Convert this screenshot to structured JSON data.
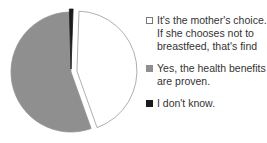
{
  "chart_data": {
    "type": "pie",
    "title": "",
    "slices": [
      {
        "label": "It's the mother's choice. If she chooses not to breastfeed, that's find",
        "value": 44,
        "fill": "#ffffff",
        "stroke": "#999999",
        "exploded": true
      },
      {
        "label": "Yes, the health benefits are proven.",
        "value": 55,
        "fill": "#8f8f8f",
        "stroke": "#8f8f8f",
        "exploded": false
      },
      {
        "label": "I don't know.",
        "value": 1,
        "fill": "#1a1a1a",
        "stroke": "#1a1a1a",
        "exploded": true
      }
    ],
    "legend": {
      "position": "right",
      "entries": [
        "It's the mother's choice. If she chooses not to breastfeed, that's find",
        "Yes, the health benefits are proven.",
        "I don't know."
      ]
    },
    "start_angle_deg": 2,
    "direction": "clockwise"
  }
}
